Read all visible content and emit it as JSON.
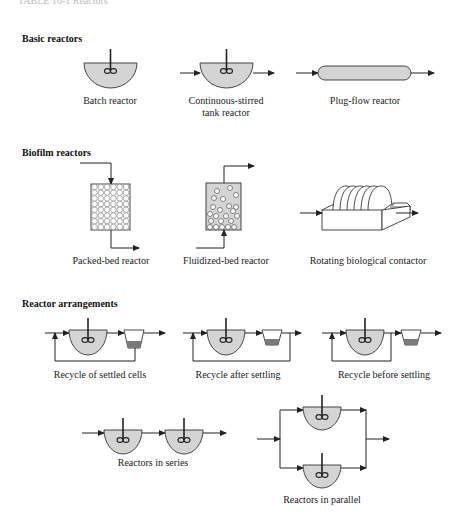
{
  "figure": {
    "top_cut_text": "TABLE 10-1   Reactors",
    "colors": {
      "liquid": "#d4d4d4",
      "sludge": "#7a7a7a",
      "line": "#222222"
    },
    "sections": [
      {
        "title": "Basic reactors",
        "items": [
          {
            "label": "Batch reactor"
          },
          {
            "label_line1": "Continuous-stirred",
            "label_line2": "tank reactor"
          },
          {
            "label": "Plug-flow reactor"
          }
        ]
      },
      {
        "title": "Biofilm reactors",
        "items": [
          {
            "label": "Packed-bed reactor"
          },
          {
            "label": "Fluidized-bed reactor"
          },
          {
            "label": "Rotating biological contactor"
          }
        ]
      },
      {
        "title": "Reactor arrangements",
        "items": [
          {
            "label": "Recycle of settled cells"
          },
          {
            "label": "Recycle after settling"
          },
          {
            "label": "Recycle before settling"
          },
          {
            "label": "Reactors in series"
          },
          {
            "label": "Reactors in parallel"
          }
        ]
      }
    ]
  }
}
